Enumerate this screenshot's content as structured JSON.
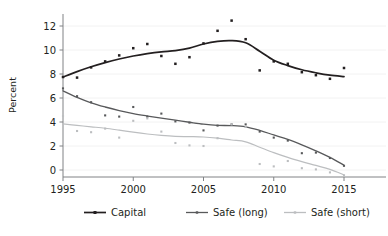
{
  "chart_data": {
    "type": "line",
    "title": "",
    "subtitle": "",
    "xlabel": "",
    "ylabel": "Percent",
    "xlim": [
      1994.4,
      2015.6
    ],
    "ylim": [
      -1.0,
      13.0
    ],
    "xticks": [
      1995,
      2000,
      2005,
      2010,
      2015
    ],
    "yticks": [
      0,
      2,
      4,
      6,
      8,
      10,
      12
    ],
    "xtick_labels": [
      "1995",
      "2000",
      "2005",
      "2010",
      "2015"
    ],
    "ytick_labels": [
      "0",
      "2",
      "4",
      "6",
      "8",
      "10",
      "12"
    ],
    "grid": "horizontal-faint",
    "legend_position": "bottom-outside",
    "x": [
      1995,
      1996,
      1997,
      1998,
      1999,
      2000,
      2001,
      2002,
      2003,
      2004,
      2005,
      2006,
      2007,
      2008,
      2009,
      2010,
      2011,
      2012,
      2013,
      2014,
      2015
    ],
    "series": [
      {
        "name": "Capital",
        "color": "#231f20",
        "marker": "square",
        "values": [
          7.75,
          7.7,
          8.55,
          9.05,
          9.55,
          10.15,
          10.5,
          9.5,
          8.85,
          9.4,
          10.55,
          11.6,
          12.45,
          10.9,
          8.3,
          9.05,
          8.85,
          8.15,
          7.9,
          7.6,
          8.5
        ],
        "smooth": [
          7.75,
          8.2,
          8.6,
          8.95,
          9.25,
          9.5,
          9.7,
          9.85,
          9.95,
          10.15,
          10.5,
          10.72,
          10.78,
          10.6,
          9.9,
          9.15,
          8.7,
          8.35,
          8.1,
          7.9,
          7.78
        ]
      },
      {
        "name": "Safe (long)",
        "color": "#58595b",
        "marker": "square",
        "values": [
          6.8,
          6.15,
          5.65,
          4.55,
          4.45,
          5.25,
          4.45,
          4.7,
          4.05,
          3.95,
          3.3,
          3.7,
          3.8,
          3.8,
          3.2,
          2.7,
          2.45,
          1.4,
          1.45,
          1.0,
          0.35
        ],
        "smooth": [
          6.6,
          6.05,
          5.6,
          5.25,
          4.95,
          4.7,
          4.5,
          4.32,
          4.15,
          3.98,
          3.82,
          3.72,
          3.7,
          3.6,
          3.3,
          2.92,
          2.55,
          2.1,
          1.6,
          1.05,
          0.4
        ]
      },
      {
        "name": "Safe (short)",
        "color": "#bcbec0",
        "marker": "square",
        "values": [
          4.5,
          3.25,
          3.15,
          3.45,
          2.7,
          4.1,
          4.3,
          3.2,
          2.25,
          2.05,
          2.0,
          2.65,
          3.8,
          3.6,
          0.5,
          0.3,
          0.75,
          0.15,
          0.05,
          -0.2,
          -0.45
        ],
        "smooth": [
          3.85,
          3.72,
          3.6,
          3.48,
          3.32,
          3.15,
          3.0,
          2.88,
          2.8,
          2.78,
          2.75,
          2.65,
          2.5,
          2.35,
          1.9,
          1.45,
          1.05,
          0.7,
          0.38,
          0.05,
          -0.4
        ]
      }
    ],
    "legend": [
      {
        "label": "Capital",
        "color": "#231f20"
      },
      {
        "label": "Safe (long)",
        "color": "#58595b"
      },
      {
        "label": "Safe (short)",
        "color": "#bcbec0"
      }
    ]
  },
  "layout": {
    "plot_left": 63,
    "plot_right": 344,
    "plot_top": 14,
    "plot_bottom": 177,
    "y_zero_px": 170,
    "px_per_unit": 12.0,
    "px_per_year": 14.05
  }
}
